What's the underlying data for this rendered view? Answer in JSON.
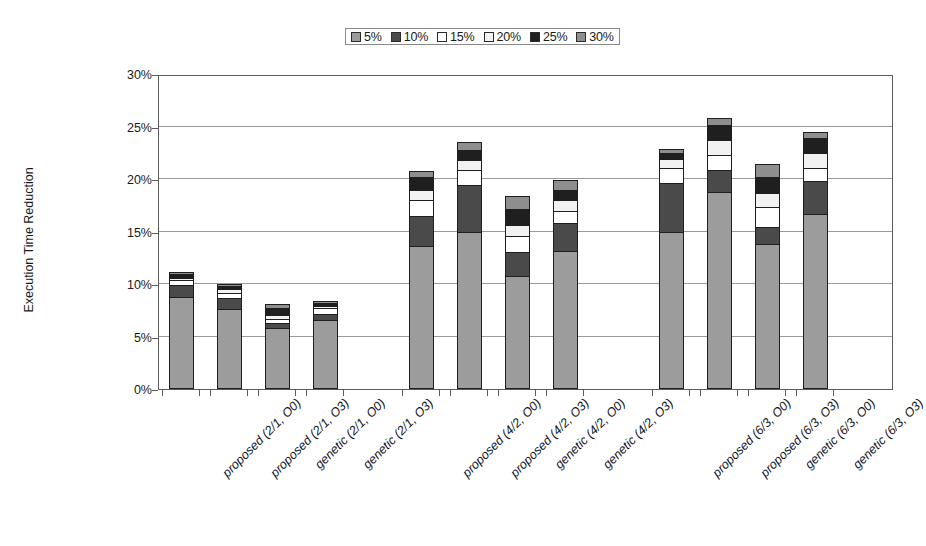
{
  "chart_data": {
    "type": "bar",
    "subtype": "stacked-column",
    "title": "",
    "xlabel": "",
    "ylabel": "Execution Time Reduction",
    "ylim": [
      0,
      30
    ],
    "ytick_labels": [
      "0%",
      "5%",
      "10%",
      "15%",
      "20%",
      "25%",
      "30%"
    ],
    "ytick_values": [
      0,
      5,
      10,
      15,
      20,
      25,
      30
    ],
    "y_unit": "%",
    "grid": true,
    "legend_position": "top-center",
    "legend_entries": [
      "5%",
      "10%",
      "15%",
      "20%",
      "25%",
      "30%"
    ],
    "series": [
      {
        "name": "5%",
        "color": "#9c9c9c",
        "values": [
          8.6,
          7.4,
          5.6,
          6.4,
          13.4,
          14.8,
          10.6,
          13.0,
          14.8,
          18.6,
          13.6,
          16.5
        ]
      },
      {
        "name": "10%",
        "color": "#4a4a4a",
        "values": [
          1.1,
          1.1,
          0.5,
          0.6,
          2.9,
          4.4,
          2.3,
          2.6,
          4.6,
          2.1,
          1.6,
          3.1
        ]
      },
      {
        "name": "15%",
        "color": "#ffffff",
        "values": [
          0.5,
          0.5,
          0.4,
          0.5,
          1.5,
          1.5,
          1.5,
          1.2,
          1.5,
          1.4,
          1.9,
          1.3
        ]
      },
      {
        "name": "20%",
        "color": "#f2f2f2",
        "values": [
          0.2,
          0.3,
          0.4,
          0.2,
          1.0,
          0.9,
          1.0,
          1.0,
          0.8,
          1.4,
          1.4,
          1.4
        ]
      },
      {
        "name": "25%",
        "color": "#1f1f1f",
        "values": [
          0.4,
          0.3,
          0.6,
          0.3,
          1.2,
          1.0,
          1.6,
          1.0,
          0.6,
          1.5,
          1.5,
          1.4
        ]
      },
      {
        "name": "30%",
        "color": "#8e8e8e",
        "values": [
          0.2,
          0.2,
          0.4,
          0.2,
          0.6,
          0.7,
          1.2,
          0.9,
          0.4,
          0.6,
          1.2,
          0.6
        ]
      }
    ],
    "categories": [
      "proposed (2/1, O0)",
      "proposed (2/1, O3)",
      "genetic (2/1, O0)",
      "genetic (2/1, O3)",
      "proposed (4/2, O0)",
      "proposed (4/2, O3)",
      "genetic (4/2, O0)",
      "genetic (4/2, O3)",
      "proposed (6/3, O0)",
      "proposed (6/3, O3)",
      "genetic (6/3, O0)",
      "genetic (6/3, O3)"
    ],
    "totals": [
      11.0,
      9.8,
      7.9,
      8.2,
      20.6,
      23.3,
      18.2,
      19.7,
      22.7,
      25.6,
      21.2,
      24.3
    ]
  },
  "legend": {
    "items": [
      {
        "label": "5%",
        "color": "#9c9c9c"
      },
      {
        "label": "10%",
        "color": "#4a4a4a"
      },
      {
        "label": "15%",
        "color": "#ffffff"
      },
      {
        "label": "20%",
        "color": "#f2f2f2"
      },
      {
        "label": "25%",
        "color": "#1f1f1f"
      },
      {
        "label": "30%",
        "color": "#8e8e8e"
      }
    ]
  },
  "axes": {
    "y_title": "Execution Time Reduction"
  }
}
